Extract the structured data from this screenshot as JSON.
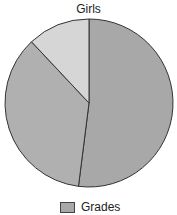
{
  "chart_data": {
    "type": "pie",
    "title": "Girls",
    "categories": [
      "Slice 1",
      "Slice 2",
      "Slice 3"
    ],
    "values": [
      52,
      36,
      12
    ],
    "colors": [
      "#a8a8a8",
      "#b0b0b0",
      "#d6d6d6"
    ],
    "legend": [
      "Grades"
    ],
    "legend_position": "bottom"
  }
}
